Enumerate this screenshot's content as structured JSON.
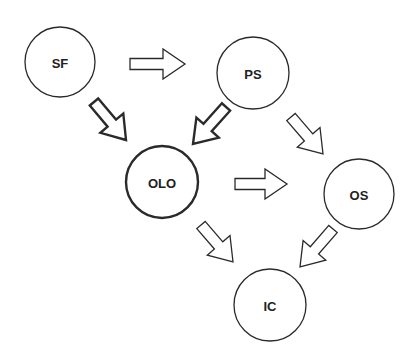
{
  "diagram": {
    "type": "flow",
    "nodes": [
      {
        "id": "SF",
        "label": "SF",
        "emphasis": false
      },
      {
        "id": "PS",
        "label": "PS",
        "emphasis": false
      },
      {
        "id": "OLO",
        "label": "OLO",
        "emphasis": true
      },
      {
        "id": "OS",
        "label": "OS",
        "emphasis": false
      },
      {
        "id": "IC",
        "label": "IC",
        "emphasis": false
      }
    ],
    "edges": [
      {
        "from": "SF",
        "to": "PS",
        "emphasis": false
      },
      {
        "from": "SF",
        "to": "OLO",
        "emphasis": true
      },
      {
        "from": "PS",
        "to": "OLO",
        "emphasis": true
      },
      {
        "from": "PS",
        "to": "OS",
        "emphasis": false
      },
      {
        "from": "OLO",
        "to": "OS",
        "emphasis": false
      },
      {
        "from": "OLO",
        "to": "IC",
        "emphasis": false
      },
      {
        "from": "OS",
        "to": "IC",
        "emphasis": false
      }
    ],
    "colors": {
      "stroke": "#2a2a2a",
      "fill": "#ffffff",
      "text": "#222222"
    }
  }
}
